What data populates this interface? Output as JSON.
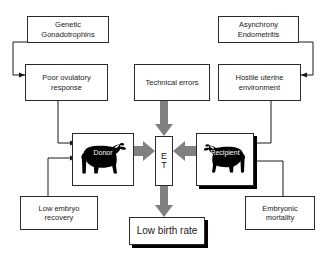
{
  "diagram": {
    "background_color": "#ffffff",
    "line_color": "#1a1a1a",
    "block_arrow_color": "#808080",
    "nodes": {
      "genetic": {
        "label": "Genetic\nGonadotrophins"
      },
      "asynchrony": {
        "label": "Asynchrony\nEndometritis"
      },
      "poor_ovulatory": {
        "label": "Poor ovulatory\nresponse"
      },
      "technical_errors": {
        "label": "Technical errors"
      },
      "hostile_uterine": {
        "label": "Hostile uterine\nenvironment"
      },
      "donor": {
        "label": "Donor"
      },
      "et": {
        "label": "E\nT"
      },
      "recipient": {
        "label": "Recipient"
      },
      "low_embryo": {
        "label": "Low embryo\nrecovery"
      },
      "embryonic_mortality": {
        "label": "Embryonic\nmortality"
      },
      "low_birth_rate": {
        "label": "Low birth rate"
      }
    },
    "edges": [
      {
        "from": "genetic",
        "to": "poor_ovulatory",
        "style": "thin"
      },
      {
        "from": "asynchrony",
        "to": "hostile_uterine",
        "style": "thin"
      },
      {
        "from": "poor_ovulatory",
        "to": "donor",
        "style": "thin"
      },
      {
        "from": "low_embryo",
        "to": "donor",
        "style": "thin"
      },
      {
        "from": "hostile_uterine",
        "to": "recipient",
        "style": "thin"
      },
      {
        "from": "embryonic_mortality",
        "to": "recipient",
        "style": "thin"
      },
      {
        "from": "donor",
        "to": "et",
        "style": "block"
      },
      {
        "from": "recipient",
        "to": "et",
        "style": "block"
      },
      {
        "from": "technical_errors",
        "to": "et",
        "style": "block"
      },
      {
        "from": "et",
        "to": "low_birth_rate",
        "style": "block"
      }
    ]
  }
}
